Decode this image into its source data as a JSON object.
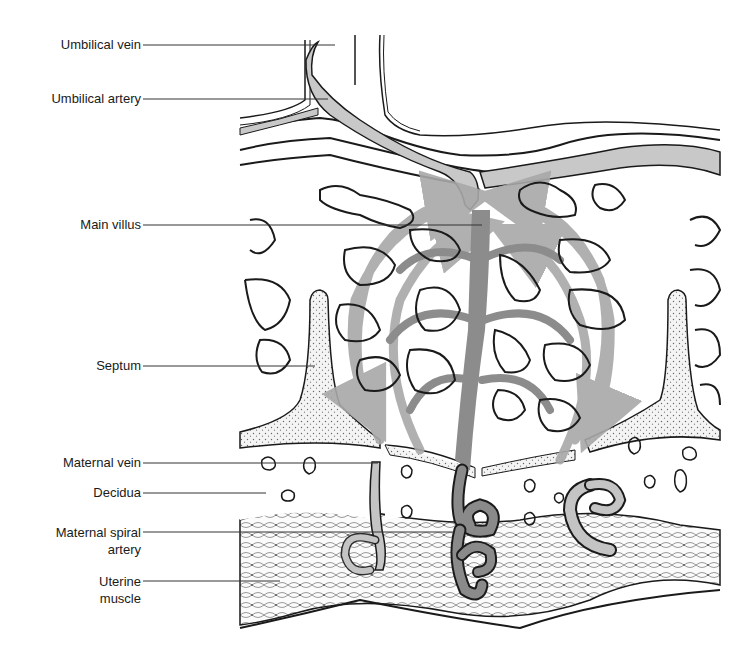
{
  "figure": {
    "colors": {
      "line": "#1a1a1a",
      "umbilical_vessel_fill": "#c8c8c8",
      "flow_arrows": "#a8a8a8",
      "villus_trunk": "#8c8c8c",
      "spiral_artery_fill": "#8a8a8a",
      "maternal_vein_fill": "#c4c4c4",
      "septum_stipple": "#777777",
      "background": "#ffffff"
    }
  },
  "labels": [
    {
      "id": "umbilical-vein",
      "text": "Umbilical vein"
    },
    {
      "id": "umbilical-artery",
      "text": "Umbilical artery"
    },
    {
      "id": "main-villus",
      "text": "Main villus"
    },
    {
      "id": "septum",
      "text": "Septum"
    },
    {
      "id": "maternal-vein",
      "text": "Maternal vein"
    },
    {
      "id": "decidua",
      "text": "Decidua"
    },
    {
      "id": "maternal-spiral-artery",
      "line1": "Maternal spiral",
      "line2": "artery"
    },
    {
      "id": "uterine-muscle",
      "line1": "Uterine",
      "line2": "muscle"
    }
  ]
}
